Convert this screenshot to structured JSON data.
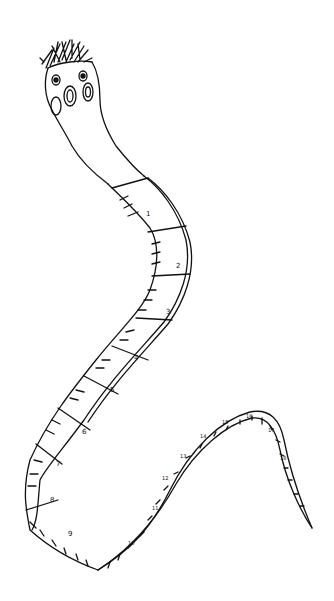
{
  "illustration": {
    "subject": "Tapeworm drawn as a measuring tape",
    "background": "#ffffff",
    "ink_color": "#111111",
    "segment_numbers": [
      "1",
      "2",
      "3",
      "4",
      "5",
      "6",
      "7",
      "8",
      "9"
    ],
    "tail_numbers": [
      "10",
      "11",
      "12",
      "13",
      "14",
      "15",
      "16",
      "17",
      "18"
    ]
  }
}
